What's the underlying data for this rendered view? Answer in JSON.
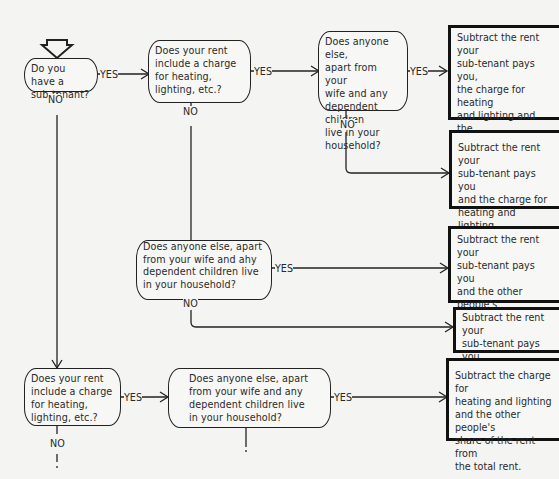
{
  "flowchart": {
    "questions": [
      {
        "id": "q1",
        "text": "Do you have a\nsub-tenant?"
      },
      {
        "id": "q2",
        "text": "Does your rent\ninclude a charge\nfor heating,\nlighting, etc.?"
      },
      {
        "id": "q3",
        "text": "Does anyone else,\napart from your\nwife and any\ndependent children\nlive in your\nhousehold?"
      },
      {
        "id": "q4",
        "text": "Does anyone else, apart\nfrom your wife and ahy\ndependent children live\nin your household?"
      },
      {
        "id": "q5",
        "text": "Does your rent\ninclude a charge\nfor heating,\nlighting, etc.?"
      },
      {
        "id": "q6",
        "text": "Does anyone else, apart\nfrom your wife and any\ndependent children live\nin your household?"
      }
    ],
    "results": [
      {
        "id": "r1",
        "text": "Subtract the rent your\nsub-tenant pays you,\nthe charge for heating\nand lighting and the\nother people's share\nof the rent from the\ntotal rent."
      },
      {
        "id": "r2",
        "text": "Subtract the rent your\nsub-tenant pays you\nand the charge for\nheating and lighting\nfrom the total rent."
      },
      {
        "id": "r3",
        "text": "Subtract the rent your\nsub-tenant pays you\nand the other people's\nshare of the rent from\nthe total rent."
      },
      {
        "id": "r4",
        "text": "Subtract the rent your\nsub-tenant pays you\nfrom the total rent."
      },
      {
        "id": "r5",
        "text": "Subtract the charge for\nheating and lighting\nand the other people's\nshare of the rent from\nthe total rent."
      }
    ],
    "labels": {
      "yes": "YES",
      "no": "NO"
    }
  }
}
